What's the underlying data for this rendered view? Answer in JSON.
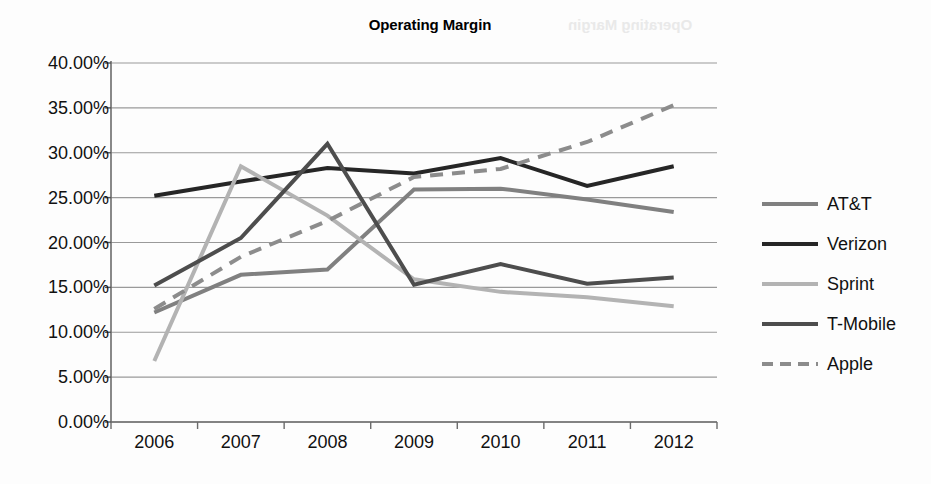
{
  "chart_data": {
    "type": "line",
    "title": "Operating Margin",
    "xlabel": "",
    "ylabel": "",
    "categories": [
      "2006",
      "2007",
      "2008",
      "2009",
      "2010",
      "2011",
      "2012"
    ],
    "ylim": [
      0,
      40
    ],
    "ytick_values": [
      40,
      35,
      30,
      25,
      20,
      15,
      10,
      5,
      0
    ],
    "ytick_labels": [
      "40.00%",
      "35.00%",
      "30.00%",
      "25.00%",
      "20.00%",
      "15.00%",
      "10.00%",
      "5.00%",
      "0.00%"
    ],
    "grid": true,
    "legend_position": "right",
    "units": "percent",
    "series": [
      {
        "name": "AT&T",
        "color": "#808080",
        "style": "solid",
        "width": 4,
        "values": [
          12.2,
          16.4,
          17.0,
          25.9,
          26.0,
          24.8,
          23.4
        ]
      },
      {
        "name": "Verizon",
        "color": "#262626",
        "style": "solid",
        "width": 4,
        "values": [
          25.2,
          26.8,
          28.3,
          27.7,
          29.4,
          26.3,
          28.5
        ]
      },
      {
        "name": "Sprint",
        "color": "#b3b3b3",
        "style": "solid",
        "width": 4,
        "values": [
          6.8,
          28.5,
          23.0,
          15.9,
          14.5,
          13.9,
          12.9
        ]
      },
      {
        "name": "T-Mobile",
        "color": "#4d4d4d",
        "style": "solid",
        "width": 4,
        "values": [
          15.2,
          20.5,
          31.0,
          15.3,
          17.6,
          15.4,
          16.1
        ]
      },
      {
        "name": "Apple",
        "color": "#8c8c8c",
        "style": "dashed",
        "width": 4,
        "values": [
          12.6,
          18.4,
          22.4,
          27.3,
          28.2,
          31.2,
          35.3
        ]
      }
    ]
  },
  "artifacts": {
    "bleed_text": "Operating Margin"
  }
}
